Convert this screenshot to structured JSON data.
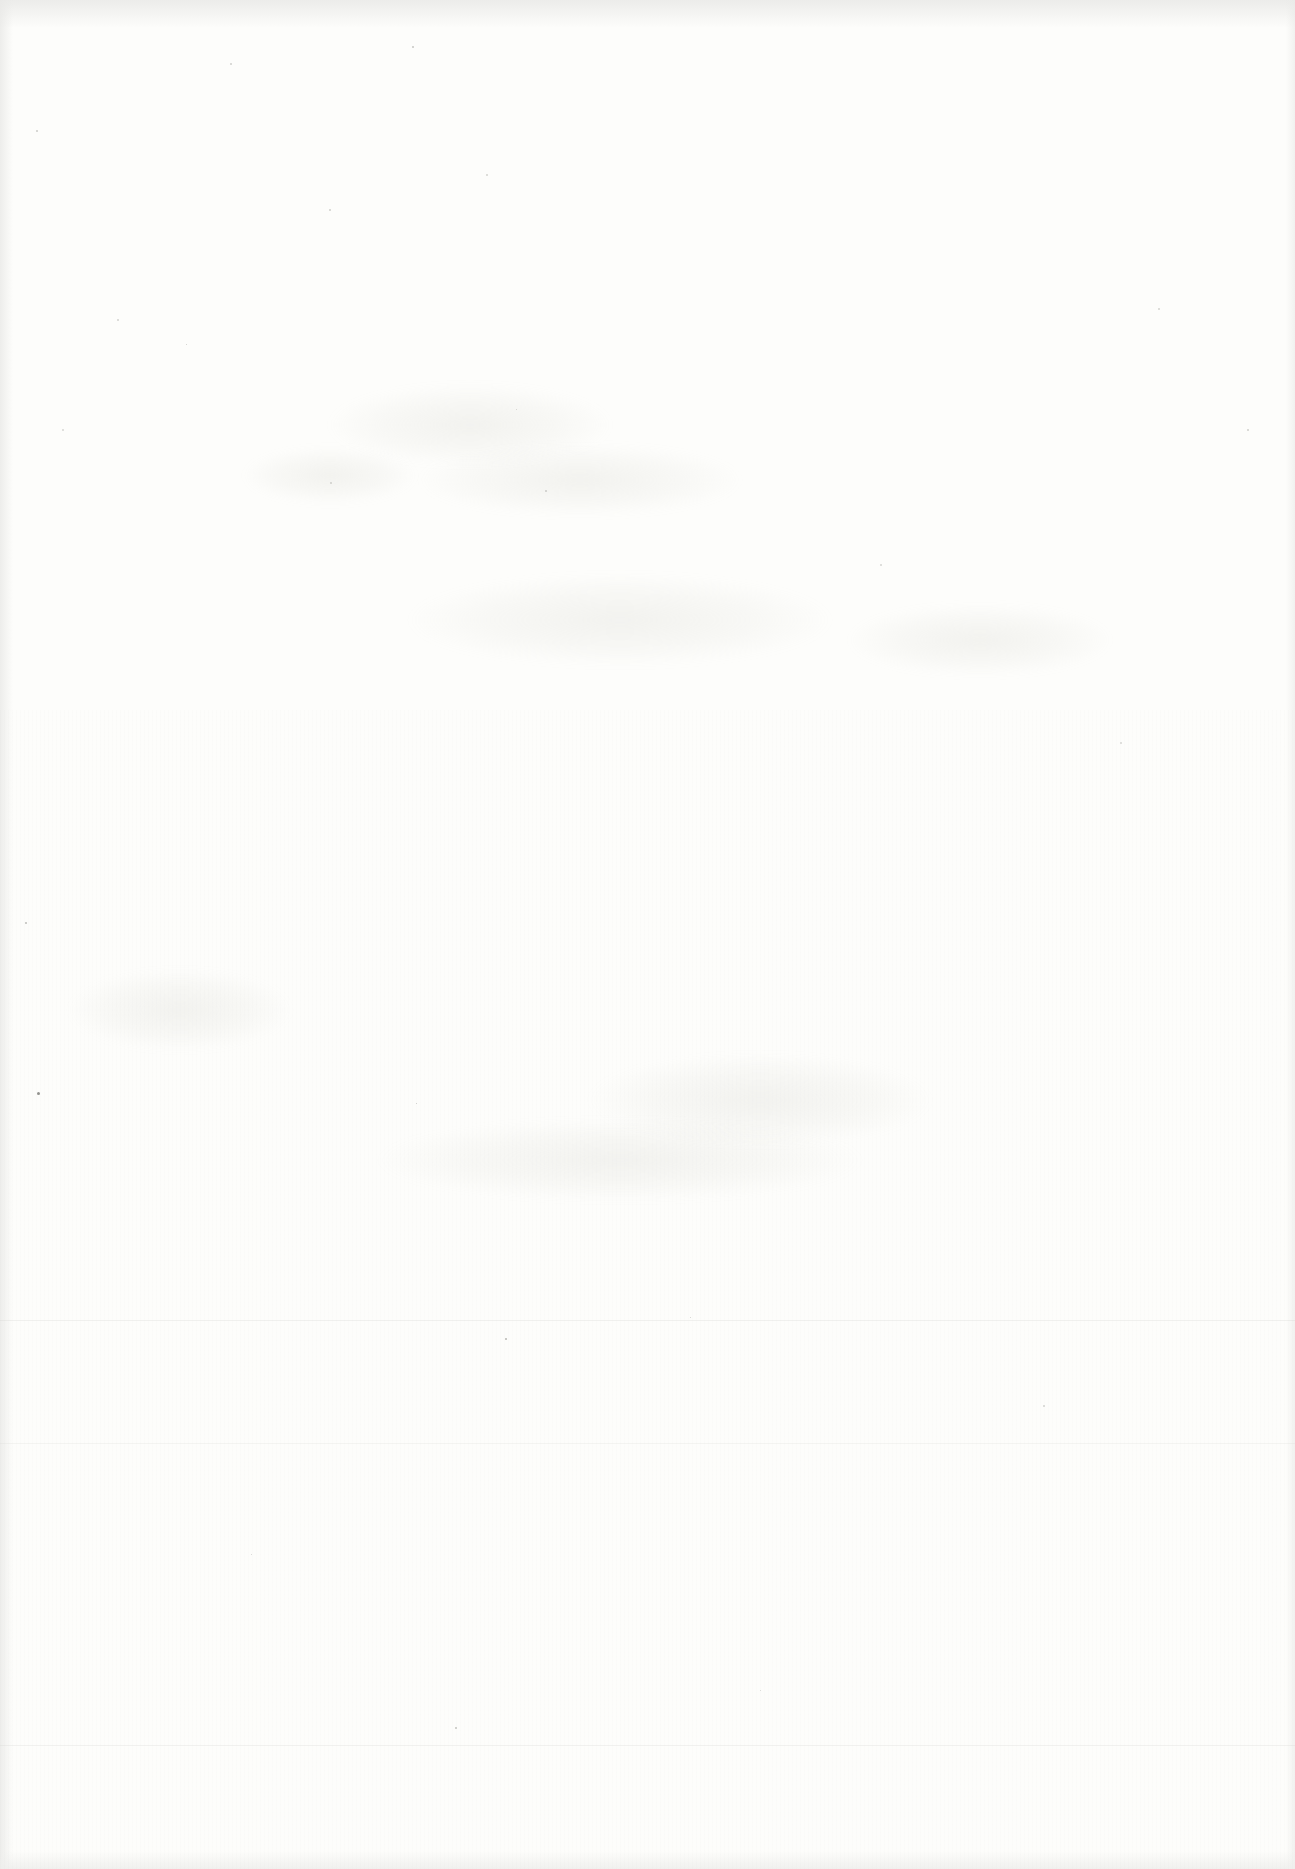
{
  "page": {
    "paper_color": "#fdfdfb",
    "bright_color": "#ffffff",
    "edge_shadow_color": "#e9e9e7",
    "bottom_band_color": "#efefed",
    "speck_default_color": "#bdbdb8"
  },
  "artifacts": {
    "smudges": [
      {
        "x": 470,
        "y": 425,
        "w": 280,
        "h": 80
      },
      {
        "x": 580,
        "y": 480,
        "w": 320,
        "h": 70
      },
      {
        "x": 330,
        "y": 475,
        "w": 170,
        "h": 55
      },
      {
        "x": 620,
        "y": 620,
        "w": 420,
        "h": 90
      },
      {
        "x": 980,
        "y": 640,
        "w": 260,
        "h": 70
      },
      {
        "x": 180,
        "y": 1010,
        "w": 220,
        "h": 80
      },
      {
        "x": 760,
        "y": 1100,
        "w": 340,
        "h": 90
      },
      {
        "x": 620,
        "y": 1160,
        "w": 480,
        "h": 80
      }
    ],
    "creases": [
      {
        "y": 1320,
        "opacity": 0.28
      },
      {
        "y": 1443,
        "opacity": 0.2
      },
      {
        "y": 1745,
        "opacity": 0.26
      }
    ],
    "specks": [
      {
        "x": 412,
        "y": 46,
        "s": 2,
        "c": "#b4b4b0"
      },
      {
        "x": 230,
        "y": 63,
        "s": 2,
        "c": "#c2c2be"
      },
      {
        "x": 36,
        "y": 130,
        "s": 2,
        "c": "#bcbcb8"
      },
      {
        "x": 486,
        "y": 174,
        "s": 2,
        "c": "#c6c6c2"
      },
      {
        "x": 329,
        "y": 209,
        "s": 2,
        "c": "#c0c0bc"
      },
      {
        "x": 117,
        "y": 319,
        "s": 2,
        "c": "#c4c4c0"
      },
      {
        "x": 186,
        "y": 344,
        "s": 1,
        "c": "#b8b8b4"
      },
      {
        "x": 516,
        "y": 409,
        "s": 1,
        "c": "#bebeba"
      },
      {
        "x": 62,
        "y": 429,
        "s": 2,
        "c": "#cacac6"
      },
      {
        "x": 330,
        "y": 482,
        "s": 2,
        "c": "#c2c2be"
      },
      {
        "x": 545,
        "y": 490,
        "s": 2,
        "c": "#bcbcb8"
      },
      {
        "x": 1158,
        "y": 308,
        "s": 2,
        "c": "#c6c6c2"
      },
      {
        "x": 1247,
        "y": 429,
        "s": 2,
        "c": "#c0c0bc"
      },
      {
        "x": 880,
        "y": 564,
        "s": 2,
        "c": "#c8c8c4"
      },
      {
        "x": 1120,
        "y": 742,
        "s": 2,
        "c": "#cacac6"
      },
      {
        "x": 25,
        "y": 922,
        "s": 2,
        "c": "#a8a8a4"
      },
      {
        "x": 37,
        "y": 1092,
        "s": 3,
        "c": "#6e6e6a"
      },
      {
        "x": 416,
        "y": 1103,
        "s": 1,
        "c": "#b4b4b0"
      },
      {
        "x": 690,
        "y": 1317,
        "s": 1,
        "c": "#bcbcb8"
      },
      {
        "x": 505,
        "y": 1338,
        "s": 2,
        "c": "#a0a09c"
      },
      {
        "x": 1043,
        "y": 1405,
        "s": 2,
        "c": "#c4c4c0"
      },
      {
        "x": 251,
        "y": 1554,
        "s": 1,
        "c": "#c2c2be"
      },
      {
        "x": 760,
        "y": 1690,
        "s": 1,
        "c": "#c6c6c2"
      },
      {
        "x": 455,
        "y": 1727,
        "s": 2,
        "c": "#b0b0ac"
      }
    ]
  }
}
